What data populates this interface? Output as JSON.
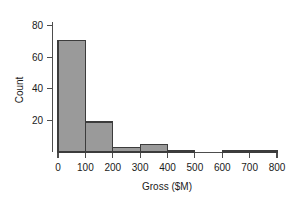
{
  "chart_data": {
    "type": "bar",
    "title": "",
    "subtitle": "",
    "xlabel": "Gross ($M)",
    "ylabel": "Count",
    "grid": false,
    "legend": null,
    "bin_width": 100,
    "xlim": [
      0,
      800
    ],
    "ylim": [
      0,
      85
    ],
    "xticks": [
      0,
      100,
      200,
      300,
      400,
      500,
      600,
      700,
      800
    ],
    "yticks": [
      20,
      40,
      60,
      80
    ],
    "xtick_labels": [
      "0",
      "100",
      "200",
      "300",
      "400",
      "500",
      "600",
      "700",
      "800"
    ],
    "ytick_labels": [
      "20",
      "40",
      "60",
      "80"
    ],
    "categories": [
      "0-100",
      "100-200",
      "200-300",
      "300-400",
      "400-500",
      "500-600",
      "600-700",
      "700-800"
    ],
    "bin_starts": [
      0,
      100,
      200,
      300,
      400,
      500,
      600,
      700
    ],
    "bin_ends": [
      100,
      200,
      300,
      400,
      500,
      600,
      700,
      800
    ],
    "values": [
      71,
      19,
      3,
      5,
      1,
      0,
      1,
      1
    ],
    "bar_fill": "#9a9a9a",
    "bar_stroke": "#3c3c3c",
    "axis_color": "#4d4d4d",
    "text_color": "#1a1a1a",
    "background": "#ffffff"
  },
  "axes": {
    "y_title": "Count",
    "x_title": "Gross ($M)"
  }
}
